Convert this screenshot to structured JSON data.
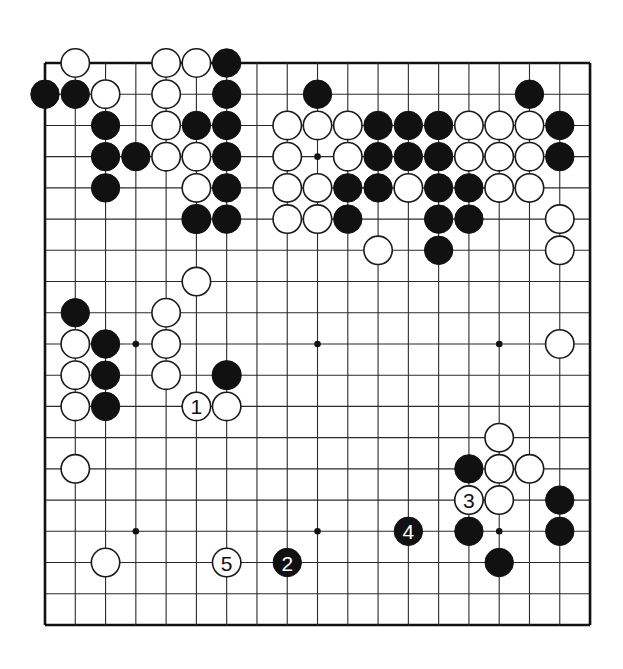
{
  "diagram": {
    "kind": "go-board-diagram",
    "board_size": 19,
    "title": "",
    "geometry": {
      "origin_x": 45,
      "origin_y": 63,
      "step_x": 30.28,
      "step_y": 31.22,
      "stone_radius": 14.2,
      "canvas_width": 623,
      "canvas_height": 669
    },
    "colors": {
      "background": "#ffffff",
      "line": "#2b2b2b",
      "border": "#111111",
      "black_stone": "#111111",
      "white_stone": "#ffffff",
      "white_stone_edge": "#1a1a1a",
      "black_label": "#ffffff",
      "white_label": "#111111"
    },
    "star_points": [
      {
        "col": 3,
        "row": 3
      },
      {
        "col": 9,
        "row": 3
      },
      {
        "col": 15,
        "row": 3
      },
      {
        "col": 3,
        "row": 9
      },
      {
        "col": 9,
        "row": 9
      },
      {
        "col": 15,
        "row": 9
      },
      {
        "col": 3,
        "row": 15
      },
      {
        "col": 9,
        "row": 15
      },
      {
        "col": 15,
        "row": 15
      }
    ],
    "black_stones": [
      {
        "col": 6,
        "row": 0
      },
      {
        "col": 0,
        "row": 1
      },
      {
        "col": 1,
        "row": 1
      },
      {
        "col": 6,
        "row": 1
      },
      {
        "col": 9,
        "row": 1
      },
      {
        "col": 16,
        "row": 1
      },
      {
        "col": 2,
        "row": 2
      },
      {
        "col": 5,
        "row": 2
      },
      {
        "col": 6,
        "row": 2
      },
      {
        "col": 11,
        "row": 2
      },
      {
        "col": 12,
        "row": 2
      },
      {
        "col": 13,
        "row": 2
      },
      {
        "col": 17,
        "row": 2
      },
      {
        "col": 2,
        "row": 3
      },
      {
        "col": 3,
        "row": 3
      },
      {
        "col": 6,
        "row": 3
      },
      {
        "col": 11,
        "row": 3
      },
      {
        "col": 12,
        "row": 3
      },
      {
        "col": 13,
        "row": 3
      },
      {
        "col": 17,
        "row": 3
      },
      {
        "col": 2,
        "row": 4
      },
      {
        "col": 6,
        "row": 4
      },
      {
        "col": 10,
        "row": 4
      },
      {
        "col": 11,
        "row": 4
      },
      {
        "col": 13,
        "row": 4
      },
      {
        "col": 14,
        "row": 4
      },
      {
        "col": 5,
        "row": 5
      },
      {
        "col": 6,
        "row": 5
      },
      {
        "col": 10,
        "row": 5
      },
      {
        "col": 13,
        "row": 5
      },
      {
        "col": 14,
        "row": 5
      },
      {
        "col": 13,
        "row": 6
      },
      {
        "col": 1,
        "row": 8
      },
      {
        "col": 2,
        "row": 9
      },
      {
        "col": 2,
        "row": 10
      },
      {
        "col": 6,
        "row": 10
      },
      {
        "col": 2,
        "row": 11
      },
      {
        "col": 5,
        "row": 11
      },
      {
        "col": 14,
        "row": 13
      },
      {
        "col": 14,
        "row": 14
      },
      {
        "col": 17,
        "row": 14
      },
      {
        "col": 14,
        "row": 15
      },
      {
        "col": 17,
        "row": 15
      },
      {
        "col": 15,
        "row": 16
      }
    ],
    "white_stones": [
      {
        "col": 1,
        "row": 0
      },
      {
        "col": 4,
        "row": 0
      },
      {
        "col": 5,
        "row": 0
      },
      {
        "col": 2,
        "row": 1
      },
      {
        "col": 4,
        "row": 1
      },
      {
        "col": 4,
        "row": 2
      },
      {
        "col": 8,
        "row": 2
      },
      {
        "col": 9,
        "row": 2
      },
      {
        "col": 10,
        "row": 2
      },
      {
        "col": 14,
        "row": 2
      },
      {
        "col": 15,
        "row": 2
      },
      {
        "col": 16,
        "row": 2
      },
      {
        "col": 4,
        "row": 3
      },
      {
        "col": 5,
        "row": 3
      },
      {
        "col": 8,
        "row": 3
      },
      {
        "col": 10,
        "row": 3
      },
      {
        "col": 14,
        "row": 3
      },
      {
        "col": 15,
        "row": 3
      },
      {
        "col": 16,
        "row": 3
      },
      {
        "col": 5,
        "row": 4
      },
      {
        "col": 8,
        "row": 4
      },
      {
        "col": 9,
        "row": 4
      },
      {
        "col": 12,
        "row": 4
      },
      {
        "col": 15,
        "row": 4
      },
      {
        "col": 16,
        "row": 4
      },
      {
        "col": 5,
        "row": 5
      },
      {
        "col": 8,
        "row": 5
      },
      {
        "col": 9,
        "row": 5
      },
      {
        "col": 17,
        "row": 5
      },
      {
        "col": 11,
        "row": 6
      },
      {
        "col": 17,
        "row": 6
      },
      {
        "col": 5,
        "row": 7
      },
      {
        "col": 4,
        "row": 8
      },
      {
        "col": 1,
        "row": 9
      },
      {
        "col": 4,
        "row": 9
      },
      {
        "col": 17,
        "row": 9
      },
      {
        "col": 1,
        "row": 10
      },
      {
        "col": 4,
        "row": 10
      },
      {
        "col": 6,
        "row": 10
      },
      {
        "col": 1,
        "row": 11
      },
      {
        "col": 6,
        "row": 11
      },
      {
        "col": 1,
        "row": 13
      },
      {
        "col": 15,
        "row": 12
      },
      {
        "col": 15,
        "row": 13
      },
      {
        "col": 16,
        "row": 13
      },
      {
        "col": 15,
        "row": 14
      },
      {
        "col": 2,
        "row": 16
      }
    ],
    "numbered_moves": [
      {
        "label": "1",
        "color": "white",
        "col": 5,
        "row": 11
      },
      {
        "label": "2",
        "color": "black",
        "col": 8,
        "row": 16
      },
      {
        "label": "3",
        "color": "white",
        "col": 14,
        "row": 14
      },
      {
        "label": "4",
        "color": "black",
        "col": 12,
        "row": 15
      },
      {
        "label": "5",
        "color": "white",
        "col": 6,
        "row": 16
      }
    ]
  }
}
